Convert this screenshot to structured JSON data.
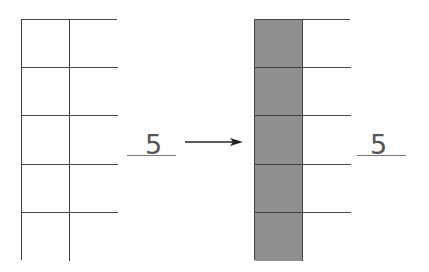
{
  "left_figure": {
    "rows": 5,
    "cols": 2,
    "shaded": [
      [
        false,
        false
      ],
      [
        false,
        false
      ],
      [
        false,
        false
      ],
      [
        false,
        false
      ],
      [
        false,
        false
      ]
    ],
    "label": "5"
  },
  "arrow": {
    "direction": "right"
  },
  "right_figure": {
    "rows": 5,
    "cols": 2,
    "shaded": [
      [
        true,
        false
      ],
      [
        true,
        false
      ],
      [
        true,
        false
      ],
      [
        true,
        false
      ],
      [
        true,
        false
      ]
    ],
    "label": "5"
  },
  "colors": {
    "shaded": "#8f8f8f",
    "lines": "#444444",
    "background": "#ffffff"
  }
}
